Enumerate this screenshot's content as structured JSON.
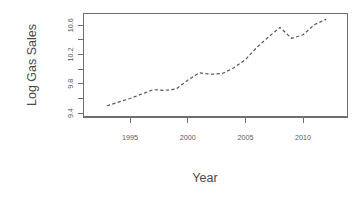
{
  "chart_data": {
    "type": "line",
    "title": "",
    "xlabel": "Year",
    "ylabel": "Log Gas  Sales",
    "xlim": [
      1992.3,
      1992.3
    ],
    "x": [
      1993,
      1994,
      1995,
      1996,
      1997,
      1998,
      1999,
      2000,
      2001,
      2002,
      2003,
      2004,
      2005,
      2006,
      2007,
      2008,
      2009,
      2010,
      2011,
      2012
    ],
    "values": [
      9.5,
      9.55,
      9.6,
      9.66,
      9.72,
      9.71,
      9.73,
      9.85,
      9.95,
      9.93,
      9.94,
      10.02,
      10.13,
      10.3,
      10.44,
      10.57,
      10.42,
      10.47,
      10.61,
      10.68
    ],
    "x_ticks": [
      1995,
      2000,
      2005,
      2010
    ],
    "x_tick_labels": [
      "1995",
      "2000",
      "2005",
      "2010"
    ],
    "y_ticks": [
      9.4,
      9.6,
      9.8,
      10.0,
      10.2,
      10.4,
      10.6
    ],
    "y_tick_labels": [
      "9.4",
      "",
      "9.8",
      "",
      "10.2",
      "",
      "10.6"
    ],
    "y_axis_range": [
      9.38,
      10.72
    ],
    "x_axis_range": [
      1992.0,
      2013.0
    ],
    "grid": false,
    "legend": null,
    "line_style": "dashed",
    "line_color": "#555555",
    "axis_color": "#6e6e6e"
  },
  "labels": {
    "y_axis_title": "Log Gas  Sales",
    "x_axis_title": "Year"
  }
}
